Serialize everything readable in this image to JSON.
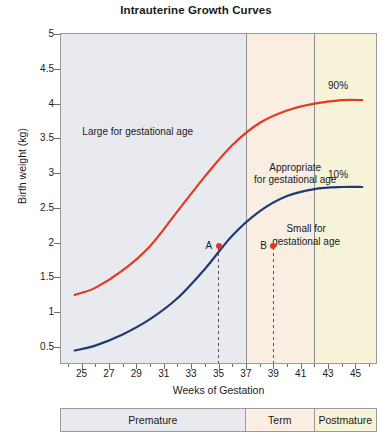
{
  "chart_data": {
    "type": "line",
    "title": "Intrauterine Growth Curves",
    "xlabel": "Weeks of Gestation",
    "ylabel": "Birth weight (kg)",
    "xlim": [
      23.5,
      46.5
    ],
    "ylim": [
      0.27,
      5
    ],
    "grid": false,
    "legend_position": "inline-end-of-line",
    "x_ticks": [
      25,
      27,
      29,
      31,
      33,
      35,
      37,
      39,
      41,
      43,
      45
    ],
    "y_ticks": [
      0.5,
      1,
      1.5,
      2,
      2.5,
      3,
      3.5,
      4,
      4.5,
      5
    ],
    "series": [
      {
        "name": "90%",
        "color": "#e03a20",
        "x": [
          24.5,
          26,
          28,
          30,
          32,
          34,
          36,
          38,
          40,
          42,
          44,
          45.5
        ],
        "values": [
          1.25,
          1.35,
          1.6,
          1.95,
          2.45,
          2.95,
          3.4,
          3.72,
          3.9,
          4.0,
          4.05,
          4.05
        ]
      },
      {
        "name": "10%",
        "color": "#1f3b73",
        "x": [
          24.5,
          26,
          28,
          30,
          32,
          34,
          36,
          38,
          40,
          42,
          44,
          45.5
        ],
        "values": [
          0.45,
          0.52,
          0.68,
          0.9,
          1.2,
          1.62,
          2.1,
          2.45,
          2.67,
          2.77,
          2.8,
          2.8
        ]
      }
    ],
    "region_labels": [
      {
        "text": "Large for gestational age",
        "x": 29.0,
        "y": 3.65
      },
      {
        "text": "Appropriate\nfor gestational age",
        "x": 40.5,
        "y": 3.12
      },
      {
        "text": "Small for\ngestational age",
        "x": 41.3,
        "y": 2.22
      }
    ],
    "annotated_points": [
      {
        "label": "A",
        "x": 35,
        "y": 1.95,
        "color": "#e8341c"
      },
      {
        "label": "B",
        "x": 39,
        "y": 1.95,
        "color": "#e8341c"
      }
    ],
    "bands": [
      {
        "name": "Premature",
        "from": 23.5,
        "to": 37,
        "color": "#e8eaf0"
      },
      {
        "name": "Term",
        "from": 37,
        "to": 42,
        "color": "#faeee2"
      },
      {
        "name": "Postmature",
        "from": 42,
        "to": 46.5,
        "color": "#f7f3d9"
      }
    ]
  },
  "series_labels": {
    "upper": "90%",
    "lower": "10%"
  },
  "region_text": {
    "large": "Large for gestational age",
    "appropriate_line1": "Appropriate",
    "appropriate_line2": "for gestational age",
    "small_line1": "Small for",
    "small_line2": "gestational age"
  },
  "points": {
    "a": "A",
    "b": "B"
  },
  "stage_bar": {
    "cells": [
      {
        "label": "Premature",
        "color": "#e8eaf0"
      },
      {
        "label": "Term",
        "color": "#faeee2"
      },
      {
        "label": "Postmature",
        "color": "#f7f3d9"
      }
    ]
  },
  "y_tick_labels": [
    "5",
    "4.5",
    "4",
    "3.5",
    "3",
    "2.5",
    "2",
    "1.5",
    "1",
    "0.5"
  ],
  "x_tick_labels": [
    "25",
    "27",
    "29",
    "31",
    "33",
    "35",
    "37",
    "39",
    "41",
    "43",
    "45"
  ]
}
